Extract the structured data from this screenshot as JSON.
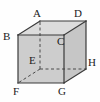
{
  "figure": {
    "name": "labelled-cube",
    "type": "geometric-solid-diagram",
    "shape": "cube",
    "projection": "oblique",
    "background_color": "#fefefe",
    "edge_color": "#3a3a3a",
    "front_face_color": "#cdcdcd",
    "side_face_color": "#c6c6c6",
    "top_face_color": "#dcdcdc",
    "hidden_edge_style": "dashed",
    "label_color": "#1b1b1b"
  },
  "vertices": [
    {
      "id": "A",
      "label": "A",
      "x": 40,
      "y": 21,
      "label_x": 33,
      "label_y": 8,
      "hidden": false,
      "position": "back-top-left"
    },
    {
      "id": "B",
      "label": "B",
      "x": 18,
      "y": 35,
      "label_x": 3,
      "label_y": 31,
      "hidden": false,
      "position": "front-top-left"
    },
    {
      "id": "C",
      "label": "C",
      "x": 64,
      "y": 35,
      "label_x": 57,
      "label_y": 36,
      "hidden": false,
      "position": "front-top-right"
    },
    {
      "id": "D",
      "label": "D",
      "x": 86,
      "y": 21,
      "label_x": 74,
      "label_y": 8,
      "hidden": false,
      "position": "back-top-right"
    },
    {
      "id": "E",
      "label": "E",
      "x": 40,
      "y": 69,
      "label_x": 29,
      "label_y": 55,
      "hidden": true,
      "position": "back-bottom-left"
    },
    {
      "id": "F",
      "label": "F",
      "x": 18,
      "y": 83,
      "label_x": 13,
      "label_y": 86,
      "hidden": false,
      "position": "front-bottom-left"
    },
    {
      "id": "G",
      "label": "G",
      "x": 64,
      "y": 83,
      "label_x": 58,
      "label_y": 86,
      "hidden": false,
      "position": "front-bottom-right"
    },
    {
      "id": "H",
      "label": "H",
      "x": 86,
      "y": 69,
      "label_x": 88,
      "label_y": 57,
      "hidden": false,
      "position": "back-bottom-right"
    }
  ],
  "edges": [
    {
      "from": "B",
      "to": "C",
      "hidden": false
    },
    {
      "from": "C",
      "to": "G",
      "hidden": false
    },
    {
      "from": "G",
      "to": "F",
      "hidden": false
    },
    {
      "from": "F",
      "to": "B",
      "hidden": false
    },
    {
      "from": "A",
      "to": "D",
      "hidden": false
    },
    {
      "from": "D",
      "to": "H",
      "hidden": false
    },
    {
      "from": "B",
      "to": "A",
      "hidden": false
    },
    {
      "from": "C",
      "to": "D",
      "hidden": false
    },
    {
      "from": "G",
      "to": "H",
      "hidden": false
    },
    {
      "from": "E",
      "to": "A",
      "hidden": true
    },
    {
      "from": "E",
      "to": "F",
      "hidden": true
    },
    {
      "from": "E",
      "to": "H",
      "hidden": true
    }
  ],
  "faces": [
    {
      "id": "top",
      "name": "ABCD-top-face",
      "points": "18,35 40,21 86,21 64,35",
      "fill": "#dcdcdc"
    },
    {
      "id": "right",
      "name": "CDHG-right-face",
      "points": "64,35 86,21 86,69 64,83",
      "fill": "#c6c6c6"
    },
    {
      "id": "front",
      "name": "BCGF-front-face",
      "points": "18,35 64,35 64,83 18,83",
      "fill": "#cdcdcd"
    }
  ]
}
